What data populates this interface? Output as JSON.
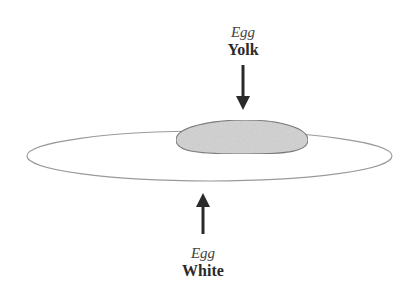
{
  "diagram": {
    "labels": {
      "yolk": {
        "prefix": "Egg",
        "name": "Yolk"
      },
      "white": {
        "prefix": "Egg",
        "name": "White"
      }
    },
    "shapes": {
      "egg_white": {
        "type": "ellipse",
        "fill": "#ffffff",
        "stroke": "#9a9a9a"
      },
      "egg_yolk": {
        "type": "ellipse",
        "fill": "#d2d2d2",
        "stroke": "#6e6e6e"
      }
    },
    "arrows": {
      "yolk_arrow": {
        "direction": "down",
        "color": "#2a2a2a"
      },
      "white_arrow": {
        "direction": "up",
        "color": "#2a2a2a"
      }
    }
  }
}
